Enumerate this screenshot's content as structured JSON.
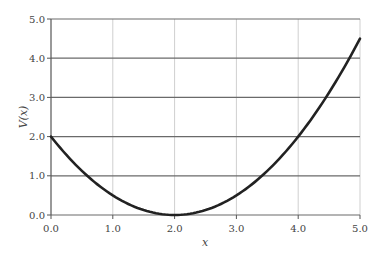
{
  "chart_data": {
    "type": "line",
    "title": "",
    "xlabel": "x",
    "ylabel": "V(x)",
    "xlim": [
      0.0,
      5.0
    ],
    "ylim": [
      0.0,
      5.0
    ],
    "xticks": [
      "0.0",
      "1.0",
      "2.0",
      "3.0",
      "4.0",
      "5.0"
    ],
    "yticks": [
      "0.0",
      "1.0",
      "2.0",
      "3.0",
      "4.0",
      "5.0"
    ],
    "grid": {
      "horizontal": true,
      "vertical": true
    },
    "legend": null,
    "series": [
      {
        "name": "V(x)",
        "color": "#222222",
        "x": [
          0.0,
          0.5,
          1.0,
          1.5,
          2.0,
          2.5,
          3.0,
          3.5,
          4.0,
          4.5,
          5.0
        ],
        "values": [
          2.0,
          1.125,
          0.5,
          0.125,
          0.0,
          0.125,
          0.5,
          1.125,
          2.0,
          3.125,
          4.5
        ]
      }
    ]
  },
  "labels": {
    "x_axis": "x",
    "y_axis": "V(x)"
  }
}
